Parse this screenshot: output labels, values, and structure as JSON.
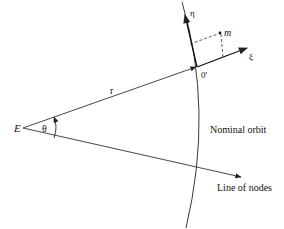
{
  "diagram": {
    "type": "orbital-reference-frame",
    "labels": {
      "earth": "E",
      "angle": "θ",
      "radius": "r",
      "origin": "0'",
      "eta_axis": "η",
      "xi_axis": "ξ",
      "mass": "m",
      "orbit": "Nominal orbit",
      "nodes_line": "Line of nodes"
    },
    "colors": {
      "line": "#222222",
      "background": "#ffffff"
    }
  }
}
